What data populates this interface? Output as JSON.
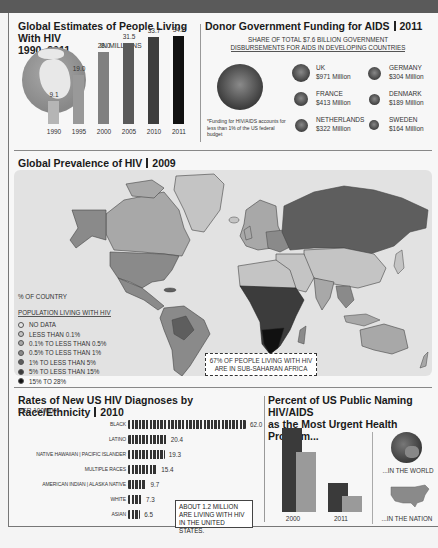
{
  "section1": {
    "title": "Global Estimates of People Living With HIV",
    "title_line2": "1990–2011",
    "unit": "IN MILLIONS"
  },
  "section2": {
    "title": "Donor Government Funding for AIDS",
    "year": "2011",
    "subtitle_line1": "SHARE OF TOTAL $7.6 BILLION GOVERNMENT",
    "subtitle_line2": "DISBURSEMENTS FOR AIDS IN DEVELOPING COUNTRIES",
    "footnote": "*Funding for HIV/AIDS accounts for less than 1% of the US federal budget",
    "donors": [
      {
        "name": "UK",
        "amount": "$971 Million"
      },
      {
        "name": "GERMANY",
        "amount": "$304 Million"
      },
      {
        "name": "FRANCE",
        "amount": "$413 Million"
      },
      {
        "name": "DENMARK",
        "amount": "$189 Million"
      },
      {
        "name": "NETHERLANDS",
        "amount": "$322 Million"
      },
      {
        "name": "SWEDEN",
        "amount": "$164 Million"
      }
    ]
  },
  "section3": {
    "title": "Global Prevalence of HIV",
    "year": "2009",
    "legend_title_1": "% OF COUNTRY",
    "legend_title_2": "POPULATION LIVING WITH HIV",
    "legend": [
      {
        "label": "NO DATA",
        "color": "#e6e6e6"
      },
      {
        "label": "LESS THAN 0.1%",
        "color": "#c4c4c4"
      },
      {
        "label": "0.1% TO LESS THAN 0.5%",
        "color": "#a8a8a8"
      },
      {
        "label": "0.5% TO LESS THAN 1%",
        "color": "#8a8a8a"
      },
      {
        "label": "1% TO LESS THAN 5%",
        "color": "#5e5e5e"
      },
      {
        "label": "5% TO LESS THAN 15%",
        "color": "#3c3c3c"
      },
      {
        "label": "15% TO 28%",
        "color": "#111111"
      }
    ],
    "callout_line1": "67% OF PEOPLE LIVING WITH HIV",
    "callout_line2": "ARE IN SUB-SAHARAN AFRICA"
  },
  "section4": {
    "title": "Rates of New US HIV Diagnoses by Race/Ethnicity",
    "year": "2010",
    "unit": "PER 100 000",
    "note_line1": "ABOUT 1.2 MILLION",
    "note_line2": "ARE LIVING WITH HIV",
    "note_line3": "IN THE UNITED STATES."
  },
  "section5": {
    "title_line1": "Percent of US Public Naming HIV/AIDS",
    "title_line2": "as the Most Urgent Health Problem...",
    "world_label": "...IN THE WORLD",
    "nation_label": "...IN THE NATION",
    "years": [
      "2000",
      "2011"
    ]
  },
  "chart_data": [
    {
      "type": "bar",
      "title": "Global Estimates of People Living With HIV 1990–2011",
      "ylabel": "IN MILLIONS",
      "categories": [
        "1990",
        "1995",
        "2000",
        "2005",
        "2010",
        "2011"
      ],
      "values": [
        9.1,
        19.0,
        28.0,
        31.5,
        33.7,
        34.2
      ],
      "labels": [
        "9.1",
        "19.0",
        "28.0",
        "31.5",
        "33.7",
        "34.2"
      ],
      "ylim": [
        0,
        35
      ]
    },
    {
      "type": "bubble",
      "title": "Donor Government Funding for AIDS 2011",
      "subtitle": "SHARE OF TOTAL $7.6 BILLION GOVERNMENT DISBURSEMENTS FOR AIDS IN DEVELOPING COUNTRIES",
      "categories": [
        "US (unlabeled)",
        "UK",
        "GERMANY",
        "FRANCE",
        "DENMARK",
        "NETHERLANDS",
        "SWEDEN"
      ],
      "values_million_usd": [
        null,
        971,
        304,
        413,
        189,
        322,
        164
      ]
    },
    {
      "type": "pictogram-bar",
      "title": "Rates of New US HIV Diagnoses by Race/Ethnicity 2010",
      "unit": "PER 100 000",
      "categories": [
        "BLACK",
        "LATINO",
        "NATIVE HAWAIIAN | PACIFIC ISLANDER",
        "MULTIPLE RACES",
        "AMERICAN INDIAN | ALASKA NATIVE",
        "WHITE",
        "ASIAN"
      ],
      "values": [
        62.0,
        20.4,
        19.3,
        15.4,
        9.7,
        7.3,
        6.5
      ],
      "labels": [
        "62.0",
        "20.4",
        "19.3",
        "15.4",
        "9.7",
        "7.3",
        "6.5"
      ]
    },
    {
      "type": "bar",
      "title": "Percent of US Public Naming HIV/AIDS as the Most Urgent Health Problem...",
      "categories": [
        "2000",
        "2011"
      ],
      "series": [
        {
          "name": "...IN THE WORLD",
          "values": [
            null,
            null
          ],
          "relative_heights": [
            1.0,
            0.35
          ],
          "color": "#3a3a3a"
        },
        {
          "name": "...IN THE NATION",
          "values": [
            null,
            null
          ],
          "relative_heights": [
            0.71,
            0.19
          ],
          "color": "#9a9a9a"
        }
      ]
    }
  ]
}
